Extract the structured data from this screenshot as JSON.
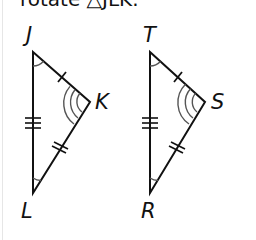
{
  "caption": "rotate △JLK.",
  "figure": {
    "stroke_color": "#111111",
    "arc_color": "#555555",
    "triangles": [
      {
        "name": "JKL",
        "vertices": {
          "J": {
            "label": "J",
            "x": 33,
            "y": 52
          },
          "K": {
            "label": "K",
            "x": 90,
            "y": 102
          },
          "L": {
            "label": "L",
            "x": 33,
            "y": 193
          }
        }
      },
      {
        "name": "TSR",
        "vertices": {
          "T": {
            "label": "T",
            "x": 150,
            "y": 52
          },
          "S": {
            "label": "S",
            "x": 205,
            "y": 102
          },
          "R": {
            "label": "R",
            "x": 150,
            "y": 193
          }
        }
      }
    ],
    "markings": {
      "single_tick_side": [
        "JK",
        "TS"
      ],
      "double_tick_side": [
        "KL",
        "SR"
      ],
      "triple_tick_side": [
        "JL",
        "TR"
      ],
      "single_arc_angle": [
        "J",
        "T",
        "L",
        "R"
      ],
      "triple_arc_angle": [
        "K",
        "S"
      ]
    }
  }
}
